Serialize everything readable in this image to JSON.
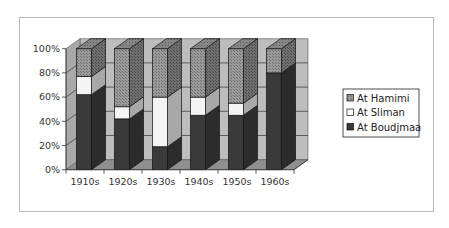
{
  "chart_data": {
    "type": "bar",
    "subtype": "stacked-100-percent-3d",
    "title": "",
    "xlabel": "",
    "ylabel": "",
    "categories": [
      "1910s",
      "1920s",
      "1930s",
      "1940s",
      "1950s",
      "1960s"
    ],
    "series": [
      {
        "name": "At Boudjmaa",
        "values": [
          62,
          42,
          19,
          45,
          45,
          80
        ],
        "color": "#3a3a3a"
      },
      {
        "name": "At Sliman",
        "values": [
          15,
          10,
          41,
          15,
          10,
          0
        ],
        "color": "#f2f2f2"
      },
      {
        "name": "At Hamimi",
        "values": [
          23,
          48,
          40,
          40,
          45,
          20
        ],
        "color": "#8c8c8c"
      }
    ],
    "yticks": [
      "0%",
      "20%",
      "40%",
      "60%",
      "80%",
      "100%"
    ],
    "ylim": [
      0,
      100
    ],
    "grid": true,
    "legend_position": "right",
    "legend": [
      "At Hamimi",
      "At Sliman",
      "At Boudjmaa"
    ]
  }
}
